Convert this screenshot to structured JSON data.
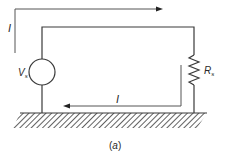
{
  "diagram": {
    "caption": "(a)",
    "caption_letter": "a",
    "labels": {
      "outer_current": "I",
      "inner_current": "I",
      "source": "V",
      "source_sub": "s",
      "resistor": "R",
      "resistor_sub": "s"
    },
    "components": [
      {
        "type": "voltage-source",
        "label": "Vs"
      },
      {
        "type": "resistor",
        "label": "Rs"
      },
      {
        "type": "ground-plane",
        "label": ""
      }
    ],
    "colors": {
      "line": "#3a3a3a",
      "background": "#ffffff"
    }
  }
}
